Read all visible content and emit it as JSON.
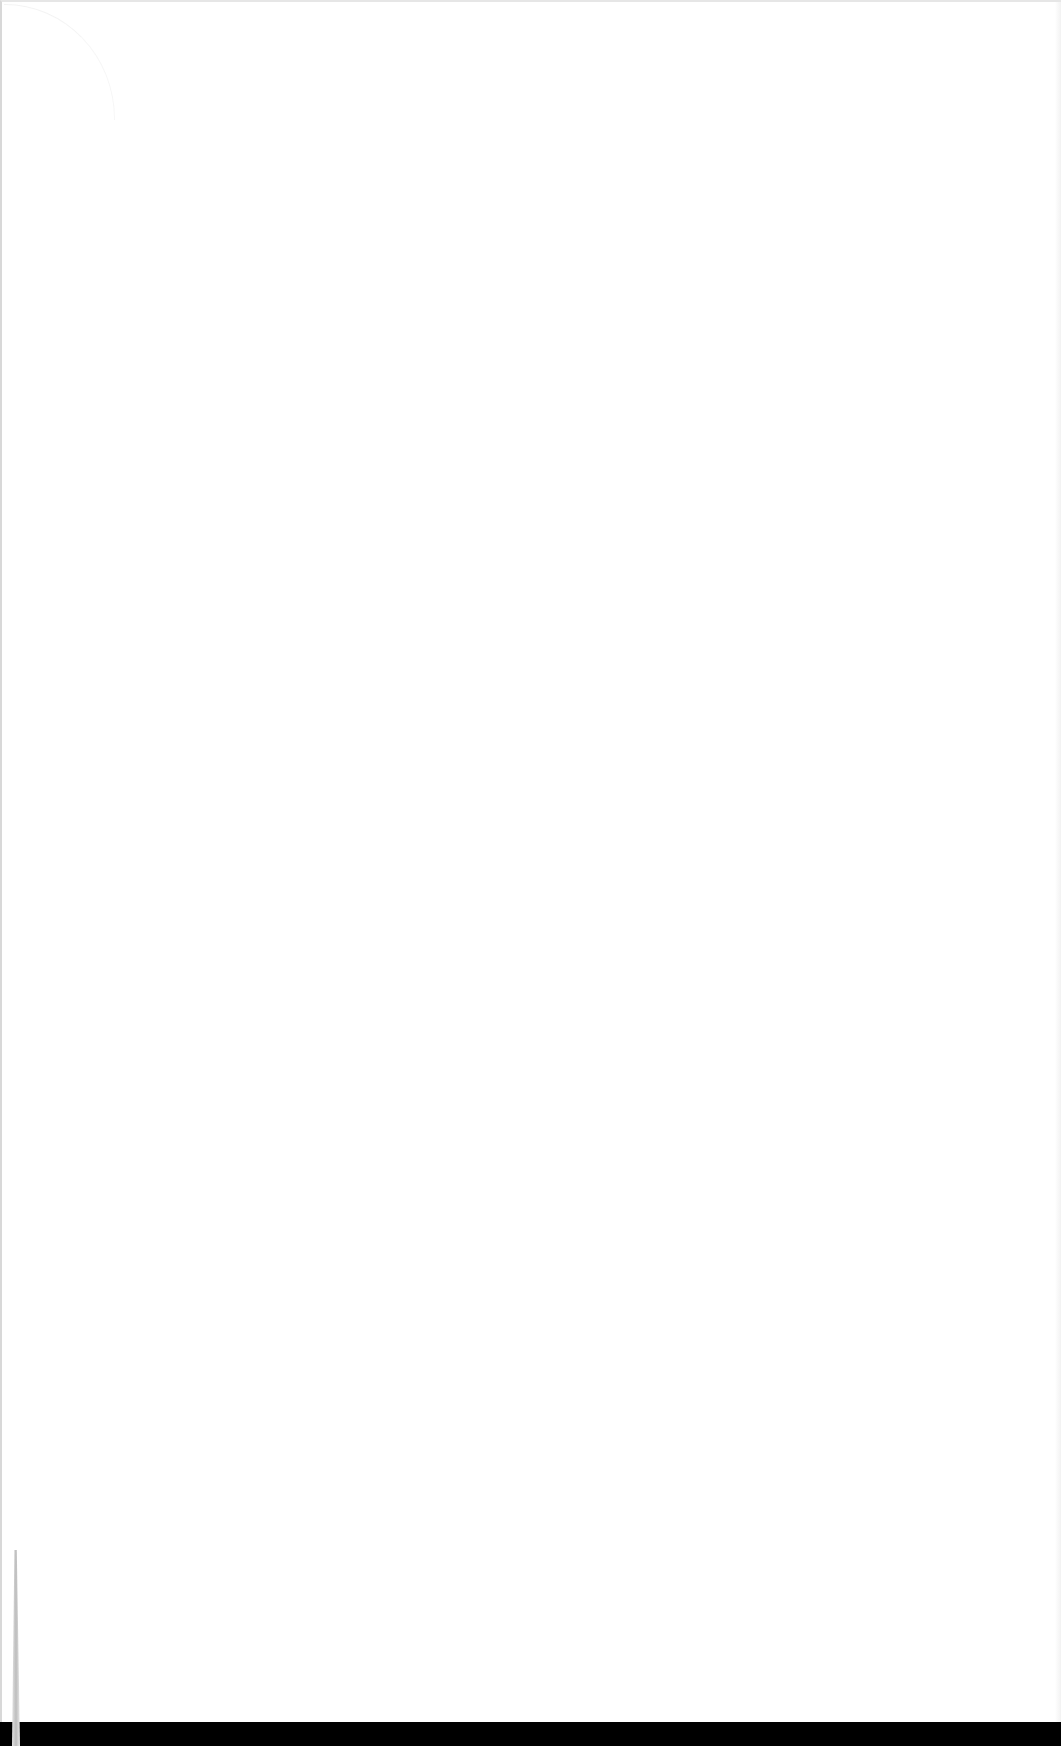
{
  "document": {
    "type": "scanned-blank-page",
    "text": ""
  },
  "colors": {
    "page": "#ffffff",
    "scanner_bed": "#000000",
    "edge": "#d8d8d8"
  }
}
